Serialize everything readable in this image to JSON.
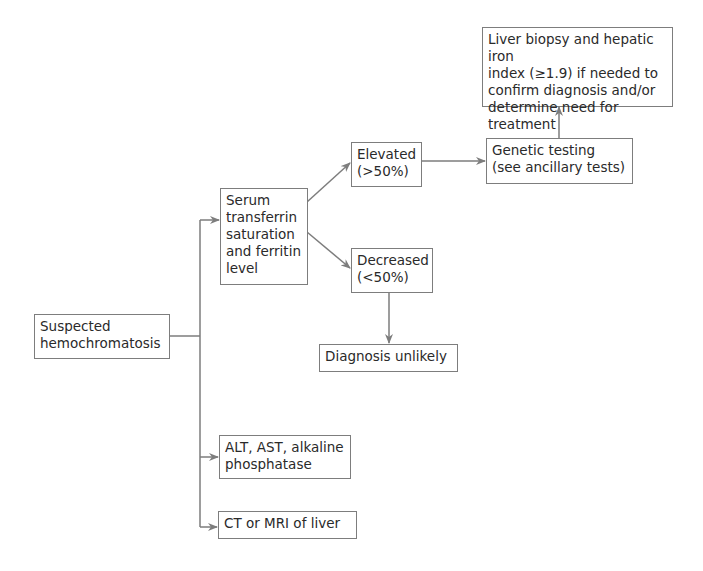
{
  "diagram": {
    "type": "flowchart",
    "nodes": {
      "suspected": {
        "label": "Suspected\nhemochromatosis"
      },
      "serum": {
        "label": "Serum\ntransferrin\nsaturation\nand ferritin\nlevel"
      },
      "elevated": {
        "label": "Elevated\n(>50%)"
      },
      "decreased": {
        "label": "Decreased\n(<50%)"
      },
      "genetic": {
        "label": "Genetic testing\n(see ancillary tests)"
      },
      "biopsy": {
        "label": "Liver biopsy and hepatic iron\nindex (≥1.9) if needed to\nconfirm diagnosis and/or\ndetermine need for treatment"
      },
      "unlikely": {
        "label": "Diagnosis unlikely"
      },
      "alt": {
        "label": "ALT, AST, alkaline\nphosphatase"
      },
      "ct": {
        "label": "CT or MRI of liver"
      }
    },
    "edges": [
      {
        "from": "suspected",
        "to": "serum"
      },
      {
        "from": "suspected",
        "to": "alt"
      },
      {
        "from": "suspected",
        "to": "ct"
      },
      {
        "from": "serum",
        "to": "elevated"
      },
      {
        "from": "serum",
        "to": "decreased"
      },
      {
        "from": "elevated",
        "to": "genetic"
      },
      {
        "from": "genetic",
        "to": "biopsy"
      },
      {
        "from": "decreased",
        "to": "unlikely"
      }
    ],
    "colors": {
      "line": "#7d7d7d",
      "text": "#2a2a2a",
      "background": "#ffffff"
    }
  }
}
